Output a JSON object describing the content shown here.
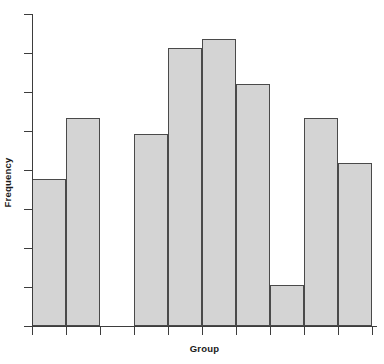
{
  "chart_data": {
    "type": "bar",
    "title": "",
    "subtitle": "",
    "xlabel": "Group",
    "ylabel": "Frequency",
    "grid": false,
    "legend": null,
    "legend_position": "none",
    "orientation": "vertical",
    "style": {
      "bar_fill": "#d4d4d4",
      "bar_border": "#4a4a4a",
      "axis_color": "#3d3d3d",
      "background": "#ffffff",
      "text_color": "#1a1a1a"
    },
    "axis": {
      "x_tick_labels": [
        "",
        "",
        "",
        "",
        "",
        "",
        "",
        "",
        "",
        "",
        ""
      ],
      "y_tick_labels": [
        "",
        "",
        "",
        "",
        "",
        "",
        "",
        "",
        ""
      ],
      "ylim": [
        0,
        9
      ],
      "xlim": [
        0,
        10
      ],
      "y_tick_values": [
        0,
        1,
        2,
        3,
        4,
        5,
        6,
        7,
        8
      ],
      "x_tick_values": [
        0,
        1,
        2,
        3,
        4,
        5,
        6,
        7,
        8,
        9,
        10
      ]
    },
    "categories": [
      "1",
      "2",
      "3",
      "4",
      "5",
      "6",
      "7",
      "8",
      "9",
      "10"
    ],
    "values": [
      4.24,
      6.0,
      0,
      5.54,
      8.02,
      8.28,
      6.98,
      1.18,
      6.0,
      4.7
    ],
    "bars": [
      {
        "index": 1,
        "bin_start": 0,
        "bin_end": 1,
        "value": 4.24,
        "height_px": 147,
        "top_px": 179,
        "empty": false
      },
      {
        "index": 2,
        "bin_start": 1,
        "bin_end": 2,
        "value": 6.0,
        "height_px": 208,
        "top_px": 118,
        "empty": false
      },
      {
        "index": 3,
        "bin_start": 2,
        "bin_end": 3,
        "value": 0,
        "height_px": 0,
        "top_px": 326,
        "empty": true
      },
      {
        "index": 4,
        "bin_start": 3,
        "bin_end": 4,
        "value": 5.54,
        "height_px": 192,
        "top_px": 134,
        "empty": false
      },
      {
        "index": 5,
        "bin_start": 4,
        "bin_end": 5,
        "value": 8.02,
        "height_px": 278,
        "top_px": 48,
        "empty": false
      },
      {
        "index": 6,
        "bin_start": 5,
        "bin_end": 6,
        "value": 8.28,
        "height_px": 287,
        "top_px": 39,
        "empty": false
      },
      {
        "index": 7,
        "bin_start": 6,
        "bin_end": 7,
        "value": 6.98,
        "height_px": 242,
        "top_px": 84,
        "empty": false
      },
      {
        "index": 8,
        "bin_start": 7,
        "bin_end": 8,
        "value": 1.18,
        "height_px": 41,
        "top_px": 285,
        "empty": false
      },
      {
        "index": 9,
        "bin_start": 8,
        "bin_end": 9,
        "value": 6.0,
        "height_px": 208,
        "top_px": 118,
        "empty": false
      },
      {
        "index": 10,
        "bin_start": 9,
        "bin_end": 10,
        "value": 4.7,
        "height_px": 163,
        "top_px": 163,
        "empty": false
      }
    ]
  }
}
